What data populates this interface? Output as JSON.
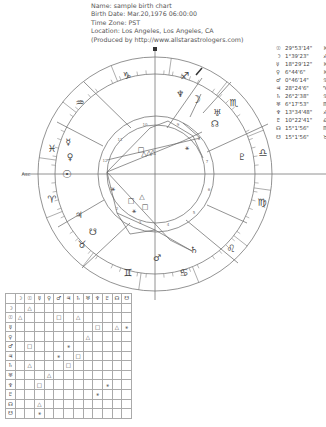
{
  "header": {
    "lines": [
      "Name: sample birth chart",
      "Birth Date: Mar.20,1976 06:00:00",
      "Time Zone: PST",
      "Location: Los Angeles, Los Angeles, CA",
      "(Produced by http://www.allstarastrologers.com)"
    ]
  },
  "positions": [
    {
      "glyph": "☉",
      "value": "29°53'14\"",
      "sign": "♓"
    },
    {
      "glyph": "☽",
      "value": "1°39'23\"",
      "sign": "♐"
    },
    {
      "glyph": "☿",
      "value": "18°29'12\"",
      "sign": "♓"
    },
    {
      "glyph": "♀",
      "value": "6°44'6\"",
      "sign": "♓"
    },
    {
      "glyph": "♂",
      "value": "0°46'14\"",
      "sign": "♋"
    },
    {
      "glyph": "♃",
      "value": "28°24'6\"",
      "sign": "♈"
    },
    {
      "glyph": "♄",
      "value": "26°2'38\"",
      "sign": "♋"
    },
    {
      "glyph": "♅",
      "value": "6°17'53\"",
      "sign": "♏"
    },
    {
      "glyph": "♆",
      "value": "13°34'48\"",
      "sign": "♐"
    },
    {
      "glyph": "♇",
      "value": "10°22'41\"",
      "sign": "♎"
    },
    {
      "glyph": "☊",
      "value": "15°1'56\"",
      "sign": "♏"
    },
    {
      "glyph": "☋",
      "value": "15°1'56\"",
      "sign": "♉"
    }
  ],
  "wheel": {
    "asc_label": "Asc",
    "mc_label": "MC",
    "house_numbers": [
      "1",
      "2",
      "3",
      "4",
      "5",
      "6",
      "7",
      "8",
      "9",
      "10",
      "11",
      "12"
    ],
    "sign_glyphs": [
      "♑",
      "♐",
      "♏",
      "♎",
      "♍",
      "♌",
      "♋",
      "♊",
      "♉",
      "♈",
      "♓",
      "♒"
    ],
    "planet_glyphs": {
      "sun": "☉",
      "moon": "☽",
      "mercury": "☿",
      "venus": "♀",
      "mars": "♂",
      "jupiter": "♃",
      "saturn": "♄",
      "uranus": "♅",
      "neptune": "♆",
      "pluto": "♇",
      "north_node": "☊",
      "south_node": "☋"
    },
    "line_color": "#777777"
  },
  "aspect_grid": {
    "headers": [
      "",
      "☽",
      "☉",
      "☿",
      "♀",
      "♂",
      "♃",
      "♄",
      "♅",
      "♆",
      "♇",
      "☊",
      "☋"
    ],
    "rows": [
      [
        "☽",
        "",
        "△",
        "",
        "",
        "",
        "",
        "",
        "",
        "",
        "",
        "",
        ""
      ],
      [
        "☉",
        "△",
        "",
        "",
        "",
        "□",
        "",
        "△",
        "",
        "",
        "",
        "",
        ""
      ],
      [
        "☿",
        "",
        "",
        "",
        "",
        "",
        "",
        "",
        "",
        "□",
        "",
        "△",
        "⚹"
      ],
      [
        "♀",
        "",
        "",
        "",
        "",
        "",
        "",
        "",
        "△",
        "",
        "",
        "",
        ""
      ],
      [
        "♂",
        "",
        "□",
        "",
        "",
        "",
        "⚹",
        "",
        "",
        "",
        "",
        "",
        ""
      ],
      [
        "♃",
        "",
        "",
        "",
        "",
        "⚹",
        "",
        "□",
        "",
        "",
        "",
        "",
        ""
      ],
      [
        "♄",
        "",
        "△",
        "",
        "",
        "",
        "□",
        "",
        "",
        "",
        "",
        "",
        ""
      ],
      [
        "♅",
        "",
        "",
        "",
        "△",
        "",
        "",
        "",
        "",
        "",
        "",
        "",
        ""
      ],
      [
        "♆",
        "",
        "",
        "□",
        "",
        "",
        "",
        "",
        "",
        "",
        "⚹",
        "",
        ""
      ],
      [
        "♇",
        "",
        "",
        "",
        "",
        "",
        "",
        "",
        "",
        "⚹",
        "",
        "",
        ""
      ],
      [
        "☊",
        "",
        "",
        "△",
        "",
        "",
        "",
        "",
        "",
        "",
        "",
        "",
        ""
      ],
      [
        "☋",
        "",
        "",
        "⚹",
        "",
        "",
        "",
        "",
        "",
        "",
        "",
        "",
        ""
      ]
    ]
  }
}
